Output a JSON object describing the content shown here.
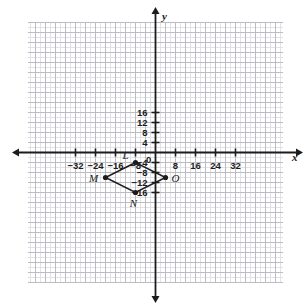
{
  "figure": {
    "kind": "coordinate-plane-quadrilateral",
    "background_color": "#ffffff",
    "axis_color": "#1c1c1c",
    "grid_minor_color": "#e2e2e6",
    "grid_major_color": "#bcbcc4",
    "shape_color": "#1c1c1c"
  },
  "chart_data": {
    "type": "scatter",
    "title": "",
    "xlabel": "x",
    "ylabel": "y",
    "grid": true,
    "legend": "none",
    "xlim": [
      -38,
      38
    ],
    "ylim": [
      -20,
      20
    ],
    "x_tick_labels": [
      "-32",
      "-24",
      "-16",
      "-8",
      "0",
      "8",
      "16",
      "24",
      "32"
    ],
    "x_tick_values": [
      -32,
      -24,
      -16,
      -8,
      0,
      8,
      16,
      24,
      32
    ],
    "y_tick_labels": [
      "16",
      "12",
      "8",
      "4",
      "-4",
      "-8",
      "-12",
      "-16"
    ],
    "y_tick_values": [
      16,
      12,
      8,
      4,
      -4,
      -8,
      -12,
      -16
    ],
    "grid_step_minor": 2,
    "grid_step_major": 4,
    "series": [
      {
        "name": "LMNO",
        "closed": true,
        "points": [
          {
            "label": "L",
            "x": -8,
            "y": -4
          },
          {
            "label": "M",
            "x": -20,
            "y": -10
          },
          {
            "label": "N",
            "x": -8,
            "y": -16
          },
          {
            "label": "O",
            "x": 4,
            "y": -10
          }
        ]
      }
    ]
  },
  "labels": {
    "x_axis": "x",
    "y_axis": "y",
    "origin": "0",
    "vertices": [
      "L",
      "M",
      "N",
      "O"
    ]
  }
}
